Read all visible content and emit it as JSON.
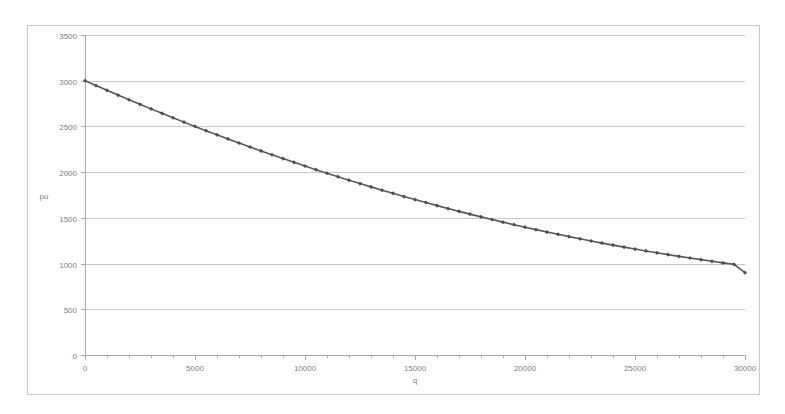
{
  "chart_data": {
    "type": "line",
    "title": "",
    "xlabel": "q",
    "ylabel": "pu",
    "xlim": [
      0,
      30000
    ],
    "ylim": [
      0,
      3500
    ],
    "grid": true,
    "legend": false,
    "legend_position": "none",
    "line_color": "#575757",
    "marker": "diamond",
    "marker_color": "#4f4f4f",
    "gridline_color": "#c9c9c9",
    "border_color": "#c8c8c8",
    "background_color": "#ffffff",
    "x_ticks": [
      0,
      5000,
      10000,
      15000,
      20000,
      25000,
      30000
    ],
    "x_tick_labels": [
      "0",
      "5000",
      "10000",
      "15000",
      "20000",
      "25000",
      "30000"
    ],
    "x_minor_tick_interval": 1000,
    "y_ticks": [
      0,
      500,
      1000,
      1500,
      2000,
      2500,
      3000,
      3500
    ],
    "y_tick_labels": [
      "0",
      "500",
      "1000",
      "1500",
      "2000",
      "2500",
      "3000",
      "3500"
    ],
    "series": [
      {
        "name": "pu",
        "x": [
          0,
          500,
          1000,
          1500,
          2000,
          2500,
          3000,
          3500,
          4000,
          4500,
          5000,
          5500,
          6000,
          6500,
          7000,
          7500,
          8000,
          8500,
          9000,
          9500,
          10000,
          10500,
          11000,
          11500,
          12000,
          12500,
          13000,
          13500,
          14000,
          14500,
          15000,
          15500,
          16000,
          16500,
          17000,
          17500,
          18000,
          18500,
          19000,
          19500,
          20000,
          20500,
          21000,
          21500,
          22000,
          22500,
          23000,
          23500,
          24000,
          24500,
          25000,
          25500,
          26000,
          26500,
          27000,
          27500,
          28000,
          28500,
          29000,
          29500,
          30000
        ],
        "values": [
          3000,
          2947,
          2895,
          2843,
          2792,
          2742,
          2692,
          2643,
          2595,
          2547,
          2500,
          2454,
          2408,
          2363,
          2319,
          2275,
          2232,
          2190,
          2148,
          2107,
          2067,
          2027,
          1988,
          1950,
          1912,
          1875,
          1839,
          1803,
          1768,
          1733,
          1700,
          1667,
          1634,
          1602,
          1571,
          1541,
          1511,
          1482,
          1453,
          1425,
          1398,
          1371,
          1345,
          1320,
          1295,
          1271,
          1247,
          1224,
          1202,
          1180,
          1159,
          1138,
          1118,
          1098,
          1079,
          1061,
          1043,
          1025,
          1008,
          992,
          900
        ]
      }
    ]
  },
  "axis_titles": {
    "x": "q",
    "y": "pu"
  }
}
